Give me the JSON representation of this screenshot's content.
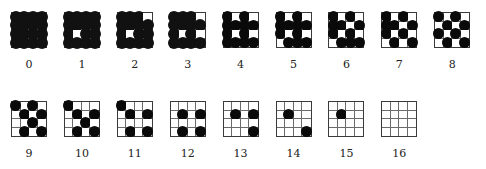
{
  "figure": {
    "grid_size": 4,
    "dot_color": "#0a0a0a",
    "patterns": [
      {
        "label": "0",
        "row": 0,
        "cells": [
          "1111",
          "1111",
          "1111",
          "1111"
        ]
      },
      {
        "label": "1",
        "row": 0,
        "cells": [
          "1111",
          "1111",
          "1011",
          "1111"
        ]
      },
      {
        "label": "2",
        "row": 0,
        "cells": [
          "1110",
          "1111",
          "1011",
          "1111"
        ]
      },
      {
        "label": "3",
        "row": 0,
        "cells": [
          "1110",
          "1111",
          "1010",
          "1111"
        ]
      },
      {
        "label": "4",
        "row": 0,
        "cells": [
          "1010",
          "1111",
          "1010",
          "1111"
        ]
      },
      {
        "label": "5",
        "row": 0,
        "cells": [
          "1010",
          "1111",
          "1010",
          "0111"
        ]
      },
      {
        "label": "6",
        "row": 0,
        "cells": [
          "1010",
          "1101",
          "1010",
          "0111"
        ]
      },
      {
        "label": "7",
        "row": 0,
        "cells": [
          "1010",
          "1101",
          "1010",
          "0101"
        ]
      },
      {
        "label": "8",
        "row": 0,
        "cells": [
          "1010",
          "0101",
          "1010",
          "0101"
        ]
      },
      {
        "label": "9",
        "row": 1,
        "cells": [
          "1010",
          "0101",
          "0010",
          "0101"
        ]
      },
      {
        "label": "10",
        "row": 1,
        "cells": [
          "1000",
          "0101",
          "0010",
          "0101"
        ]
      },
      {
        "label": "11",
        "row": 1,
        "cells": [
          "1000",
          "0101",
          "0000",
          "0101"
        ]
      },
      {
        "label": "12",
        "row": 1,
        "cells": [
          "0000",
          "0101",
          "0000",
          "0101"
        ]
      },
      {
        "label": "13",
        "row": 1,
        "cells": [
          "0000",
          "0101",
          "0000",
          "0001"
        ]
      },
      {
        "label": "14",
        "row": 1,
        "cells": [
          "0000",
          "0100",
          "0000",
          "0001"
        ]
      },
      {
        "label": "15",
        "row": 1,
        "cells": [
          "0000",
          "0100",
          "0000",
          "0000"
        ]
      },
      {
        "label": "16",
        "row": 1,
        "cells": [
          "0000",
          "0000",
          "0000",
          "0000"
        ]
      }
    ]
  }
}
